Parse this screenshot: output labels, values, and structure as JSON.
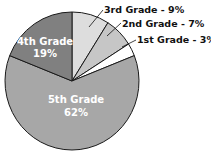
{
  "chart_data": {
    "type": "pie",
    "title": "",
    "categories": [
      "3rd Grade",
      "2nd Grade",
      "1st Grade",
      "5th Grade",
      "4th Grade"
    ],
    "values": [
      9,
      7,
      3,
      62,
      19
    ],
    "unit": "%",
    "start_angle": "12 o'clock, clockwise",
    "colors": {
      "3rd Grade": "#dddddd",
      "2nd Grade": "#c6c6c6",
      "1st Grade": "#ffffff",
      "5th Grade": "#a7a7a7",
      "4th Grade": "#808080"
    },
    "labels": {
      "inside": [
        {
          "category": "4th Grade",
          "line1": "4th Grade",
          "line2": "19%"
        },
        {
          "category": "5th Grade",
          "line1": "5th Grade",
          "line2": "62%"
        }
      ],
      "callouts": [
        {
          "category": "3rd Grade",
          "text": "3rd Grade - 9%"
        },
        {
          "category": "2nd Grade",
          "text": "2nd Grade - 7%"
        },
        {
          "category": "1st Grade",
          "text": "1st Grade - 3%"
        }
      ]
    },
    "legend": "none"
  }
}
